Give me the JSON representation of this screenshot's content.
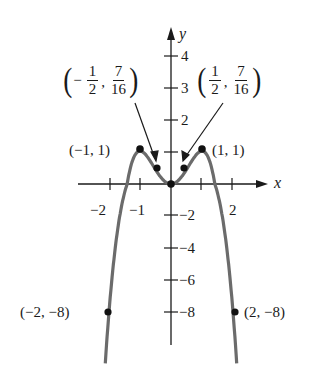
{
  "chart_data": {
    "type": "line",
    "title": "",
    "function": "y = 2x^2 - x^4",
    "xlabel": "x",
    "ylabel": "y",
    "x_ticks": [
      -2,
      -1,
      1,
      2
    ],
    "x_tick_labels": [
      "-2",
      "-1",
      "",
      "2"
    ],
    "y_ticks": [
      4,
      3,
      2,
      1,
      -2,
      -4,
      -6,
      -8
    ],
    "y_tick_labels": [
      "4",
      "3",
      "2",
      "",
      "-2",
      "-4",
      "-6",
      "-8"
    ],
    "xlim": [
      -2.1,
      2.1
    ],
    "ylim": [
      -10,
      4.5
    ],
    "grid": false,
    "series": [
      {
        "name": "curve",
        "x": [
          -2.1,
          -2,
          -1.5,
          -1,
          -0.5,
          0,
          0.5,
          1,
          1.5,
          2,
          2.1
        ],
        "values": [
          -10.63,
          -8,
          -0.56,
          1,
          0.4375,
          0,
          0.4375,
          1,
          -0.56,
          -8,
          -10.63
        ]
      }
    ],
    "marked_points": [
      {
        "x": -2,
        "y": -8,
        "label": "(-2, -8)"
      },
      {
        "x": -1,
        "y": 1,
        "label": "(-1, 1)"
      },
      {
        "x": -0.5,
        "y": 0.4375,
        "label": "(-1/2, 7/16)"
      },
      {
        "x": 0,
        "y": 0,
        "label": ""
      },
      {
        "x": 0.5,
        "y": 0.4375,
        "label": "(1/2, 7/16)"
      },
      {
        "x": 1,
        "y": 1,
        "label": "(1, 1)"
      },
      {
        "x": 2,
        "y": -8,
        "label": "(2, -8)"
      }
    ]
  },
  "axes": {
    "x_label": "x",
    "y_label": "y",
    "x_ticks": {
      "neg2": "−2",
      "neg1": "−1",
      "pos2": "2"
    },
    "y_ticks": {
      "p4": "4",
      "p3": "3",
      "p2": "2",
      "n2": "−2",
      "n4": "−4",
      "n6": "−6",
      "n8": "−8"
    }
  },
  "annotations": {
    "left_half": {
      "sign": "−",
      "x_num": "1",
      "x_den": "2",
      "y_num": "7",
      "y_den": "16",
      "comma": ","
    },
    "right_half": {
      "x_num": "1",
      "x_den": "2",
      "y_num": "7",
      "y_den": "16",
      "comma": ","
    },
    "neg1_1": "(−1, 1)",
    "pos1_1": "(1, 1)",
    "neg2_neg8": "(−2, −8)",
    "pos2_neg8": "(2, −8)",
    "paren_open": "(",
    "paren_close": ")"
  },
  "colors": {
    "curve": "#6b6b6b",
    "axis": "#1a1a1a",
    "point": "#111111"
  }
}
